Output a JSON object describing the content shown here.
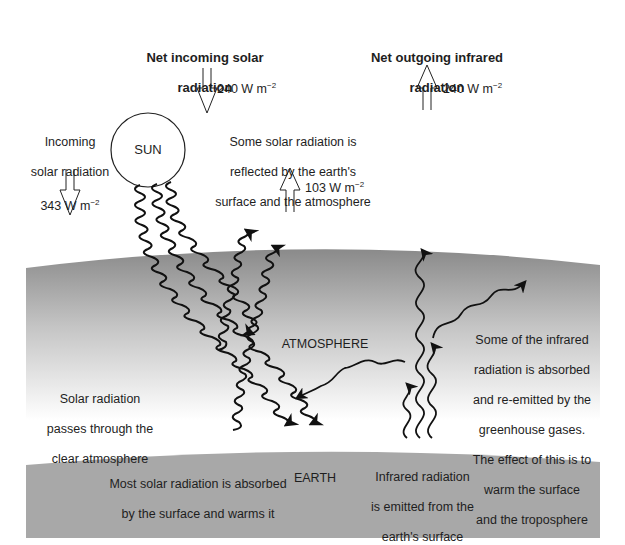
{
  "colors": {
    "atmosphere_top": "#8e8e8e",
    "atmosphere_bottom": "#ffffff",
    "earth": "#a9a9a9",
    "ink": "#1a1a1a",
    "background": "#ffffff"
  },
  "headers": {
    "net_incoming": {
      "line1": "Net incoming solar",
      "line2": "radiation"
    },
    "net_outgoing": {
      "line1": "Net outgoing infrared",
      "line2": "radiation"
    }
  },
  "flux_values": {
    "net_incoming": {
      "number": "240 W m",
      "exponent": "−2",
      "direction": "down"
    },
    "net_outgoing": {
      "number": "240 W m",
      "exponent": "−2",
      "direction": "up"
    },
    "reflected": {
      "number": "103 W m",
      "exponent": "−2",
      "direction": "up"
    }
  },
  "incoming": {
    "line1": "Incoming",
    "line2": "solar radiation",
    "value": "343 W m",
    "exponent": "−2"
  },
  "sun": {
    "label": "SUN"
  },
  "reflected_text": {
    "line1": "Some solar radiation is",
    "line2": "reflected by the earth's",
    "line3": "surface and the atmosphere"
  },
  "layers": {
    "atmosphere": "ATMOSPHERE",
    "earth": "EARTH"
  },
  "passes_text": {
    "line1": "Solar radiation",
    "line2": "passes through the",
    "line3": "clear atmosphere"
  },
  "absorbed_text": {
    "line1": "Most solar radiation is absorbed",
    "line2": "by the surface and warms it"
  },
  "infrared_emitted_text": {
    "line1": "Infrared radiation",
    "line2": "is emitted from the",
    "line3": "earth's surface"
  },
  "greenhouse_text": {
    "line1": "Some of the infrared",
    "line2": "radiation is absorbed",
    "line3": "and re-emitted by the",
    "line4": "greenhouse gases.",
    "line5": "The effect of this is to",
    "line6": "warm the surface",
    "line7": "and the troposphere"
  }
}
